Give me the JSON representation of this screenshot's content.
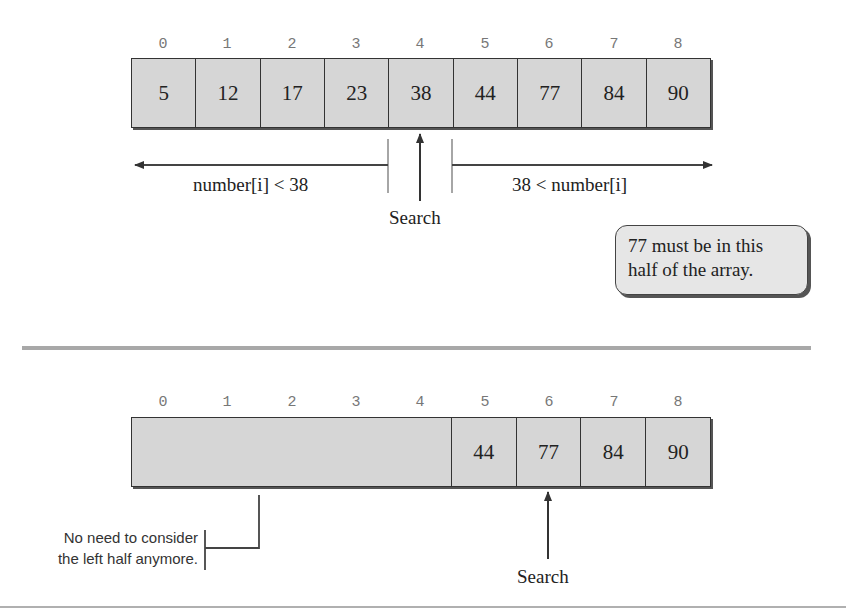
{
  "top_panel": {
    "indices": [
      "0",
      "1",
      "2",
      "3",
      "4",
      "5",
      "6",
      "7",
      "8"
    ],
    "values": [
      "5",
      "12",
      "17",
      "23",
      "38",
      "44",
      "77",
      "84",
      "90"
    ],
    "left_range_label": "number[i] < 38",
    "right_range_label": "38 < number[i]",
    "search_label": "Search",
    "search_index": 4,
    "callout": {
      "line1": "77 must be in this",
      "line2": "half of the array."
    }
  },
  "bottom_panel": {
    "indices": [
      "0",
      "1",
      "2",
      "3",
      "4",
      "5",
      "6",
      "7",
      "8"
    ],
    "values": [
      "",
      "",
      "",
      "",
      "",
      "44",
      "77",
      "84",
      "90"
    ],
    "search_label": "Search",
    "search_index": 6,
    "note": {
      "line1": "No need to consider",
      "line2": "the left half anymore."
    }
  },
  "colors": {
    "cell_fill": "#d6d6d6",
    "border": "#333333",
    "divider": "#a8a8a8",
    "index_text": "#777777"
  }
}
